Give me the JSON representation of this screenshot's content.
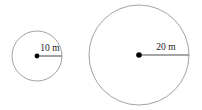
{
  "figure": {
    "background_color": "#ffffff",
    "stroke_color": "#8a8a8a",
    "radius_line_color": "#8a8a8a",
    "dot_color": "#000000",
    "label_color": "#1a1a1a",
    "shapes": [
      {
        "name": "small-circle",
        "label": "10 m",
        "radius_value": 10,
        "units": "m",
        "cx": 37,
        "cy": 56,
        "r": 25,
        "dot_r": 2.4,
        "stroke_width": 0.8,
        "radius_line": {
          "x1": 37,
          "y1": 56,
          "x2": 62,
          "y2": 56,
          "width": 1.6
        },
        "label_x": 50,
        "label_y": 51
      },
      {
        "name": "large-circle",
        "label": "20 m",
        "radius_value": 20,
        "units": "m",
        "cx": 139,
        "cy": 55,
        "r": 50,
        "dot_r": 2.8,
        "stroke_width": 0.8,
        "radius_line": {
          "x1": 139,
          "y1": 55,
          "x2": 189,
          "y2": 55,
          "width": 1.6
        },
        "label_x": 166,
        "label_y": 50
      }
    ]
  }
}
